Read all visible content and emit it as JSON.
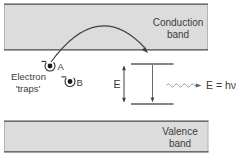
{
  "diagram": {
    "conduction_band": {
      "label_line1": "Conduction",
      "label_line2": "band"
    },
    "valence_band": {
      "label_line1": "Valence",
      "label_line2": "band"
    },
    "traps": {
      "caption_line1": "Electron",
      "caption_line2": "'traps'",
      "trap_a_label": "A",
      "trap_b_label": "B"
    },
    "energy": {
      "gap_label": "E",
      "photon_equation": "E = hν"
    },
    "colors": {
      "background": "#ffffff",
      "band_fill": "#dcdcdc",
      "band_edge_dark": "#6e6e6e",
      "band_edge_light": "#b3b3b3",
      "level_line": "#5a5a5a",
      "arrow_line": "#3f3f3f",
      "photon_wave": "#989898",
      "text": "#3b3b3b"
    }
  }
}
